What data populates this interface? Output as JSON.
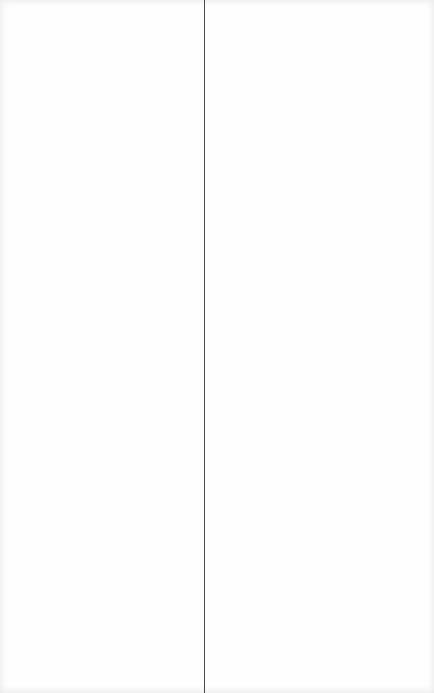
{
  "layout": {
    "type": "split-pane",
    "divider_x": 204,
    "colors": {
      "background": "#fefefe",
      "divider": "#4a4a4a"
    }
  },
  "left_pane": {
    "content": ""
  },
  "right_pane": {
    "content": ""
  }
}
